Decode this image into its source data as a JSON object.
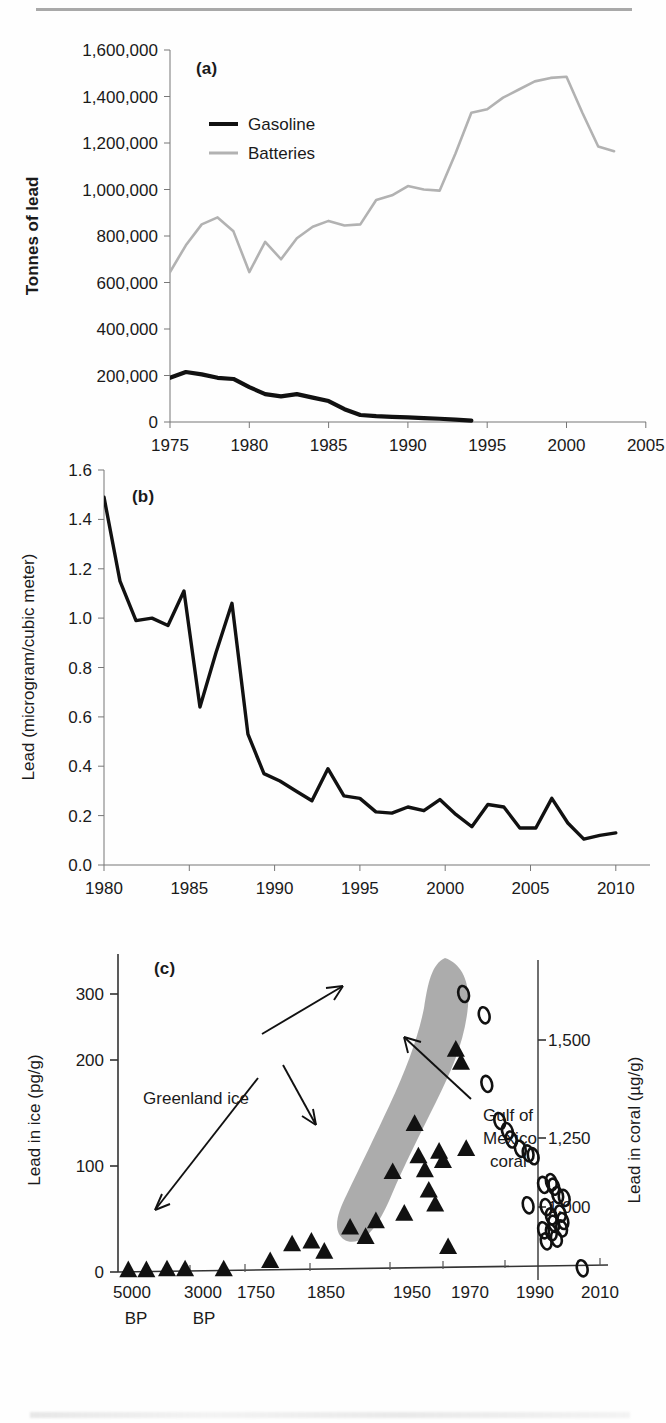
{
  "figure": {
    "panel_labels": {
      "a": "(a)",
      "b": "(b)",
      "c": "(c)"
    }
  },
  "chart_data": [
    {
      "id": "panel-a",
      "type": "line",
      "panel_label": "(a)",
      "title": "",
      "xlabel": "",
      "ylabel": "Tonnes of lead",
      "xlim": [
        1975,
        2005
      ],
      "ylim": [
        0,
        1600000
      ],
      "xticks": [
        1975,
        1980,
        1985,
        1990,
        1995,
        2000,
        2005
      ],
      "xtick_labels": [
        "1975",
        "1980",
        "1985",
        "1990",
        "1995",
        "2000",
        "2005"
      ],
      "yticks": [
        0,
        200000,
        400000,
        600000,
        800000,
        1000000,
        1200000,
        1400000,
        1600000
      ],
      "ytick_labels": [
        "0",
        "200,000",
        "400,000",
        "600,000",
        "800,000",
        "1,000,000",
        "1,200,000",
        "1,400,000",
        "1,600,000"
      ],
      "grid": false,
      "legend_position": "upper-left-inside",
      "x": [
        1975,
        1976,
        1977,
        1978,
        1979,
        1980,
        1981,
        1982,
        1983,
        1984,
        1985,
        1986,
        1987,
        1988,
        1989,
        1990,
        1991,
        1992,
        1993,
        1994,
        1995,
        1996,
        1997,
        1998,
        1999,
        2000,
        2001,
        2002,
        2003
      ],
      "series": [
        {
          "name": "Gasoline",
          "color": "#111111",
          "values": [
            190000,
            215000,
            205000,
            190000,
            185000,
            150000,
            120000,
            110000,
            120000,
            105000,
            90000,
            55000,
            30000,
            25000,
            22000,
            20000,
            17000,
            14000,
            10000,
            6000,
            null,
            null,
            null,
            null,
            null,
            null,
            null,
            null,
            null
          ]
        },
        {
          "name": "Batteries",
          "color": "#b2b2b2",
          "values": [
            645000,
            760000,
            850000,
            880000,
            820000,
            645000,
            775000,
            700000,
            790000,
            840000,
            865000,
            845000,
            850000,
            955000,
            975000,
            1015000,
            1000000,
            995000,
            1155000,
            1330000,
            1345000,
            1395000,
            1430000,
            1465000,
            1480000,
            1485000,
            1330000,
            1185000,
            1165000
          ]
        }
      ]
    },
    {
      "id": "panel-b",
      "type": "line",
      "panel_label": "(b)",
      "title": "",
      "xlabel": "",
      "ylabel": "Lead (microgram/cubic meter)",
      "xlim": [
        1980,
        2012
      ],
      "ylim": [
        0.0,
        1.6
      ],
      "xticks": [
        1980,
        1985,
        1990,
        1995,
        2000,
        2005,
        2010
      ],
      "xtick_labels": [
        "1980",
        "1985",
        "1990",
        "1995",
        "2000",
        "2005",
        "2010"
      ],
      "yticks": [
        0.0,
        0.2,
        0.4,
        0.6,
        0.8,
        1.0,
        1.2,
        1.4,
        1.6
      ],
      "ytick_labels": [
        "0.0",
        "0.2",
        "0.4",
        "0.6",
        "0.8",
        "1.0",
        "1.2",
        "1.4",
        "1.6"
      ],
      "grid": false,
      "legend_position": "none",
      "x": [
        1980,
        1981,
        1982,
        1983,
        1984,
        1985,
        1986,
        1987,
        1988,
        1989,
        1990,
        1991,
        1992,
        1993,
        1994,
        1995,
        1996,
        1997,
        1998,
        1999,
        2000,
        2001,
        2002,
        2003,
        2004,
        2005,
        2006,
        2007,
        2008,
        2009,
        2010,
        2011,
        2012
      ],
      "series": [
        {
          "name": "Lead in air",
          "color": "#111111",
          "values": [
            1.49,
            1.15,
            0.99,
            1.0,
            0.97,
            1.11,
            0.64,
            0.86,
            1.06,
            0.53,
            0.37,
            0.34,
            0.3,
            0.26,
            0.39,
            0.28,
            0.27,
            0.215,
            0.21,
            0.235,
            0.22,
            0.265,
            0.205,
            0.155,
            0.245,
            0.235,
            0.15,
            0.15,
            0.27,
            0.17,
            0.105,
            0.12,
            0.13
          ]
        }
      ]
    },
    {
      "id": "panel-c",
      "type": "scatter",
      "panel_label": "(c)",
      "title": "",
      "xlabel": "",
      "ylabel": "Lead in ice (pg/g)",
      "ylabel_right": "Lead in coral (µg/g)",
      "ylim": [
        0,
        320
      ],
      "yticks": [
        0,
        100,
        200,
        300
      ],
      "ytick_labels": [
        "0",
        "100",
        "200",
        "300"
      ],
      "yticks_right": [
        1000,
        1250,
        1500
      ],
      "ytick_labels_right": [
        "1,000",
        "1,250",
        "1,500"
      ],
      "xtick_labels": [
        "5000",
        "3000",
        "1750",
        "1850",
        "1950",
        "1970",
        "1990",
        "2010"
      ],
      "xtick_sublabels": [
        "BP",
        "BP",
        "",
        "",
        "",
        "",
        "",
        ""
      ],
      "grid": false,
      "annotations": [
        {
          "text": "Greenland ice",
          "target": "triangles"
        },
        {
          "text": "Gulf of",
          "target": "coral-band"
        },
        {
          "text": "Mexico",
          "target": "coral-band"
        },
        {
          "text": "coral",
          "target": "coral-band"
        }
      ],
      "series": [
        {
          "name": "Greenland ice",
          "marker": "filled-triangle",
          "color": "#111111",
          "points": [
            [
              8,
              2
            ],
            [
              22,
              2
            ],
            [
              38,
              3
            ],
            [
              52,
              3
            ],
            [
              82,
              3
            ],
            [
              118,
              12
            ],
            [
              135,
              30
            ],
            [
              150,
              33
            ],
            [
              160,
              22
            ],
            [
              180,
              48
            ],
            [
              192,
              38
            ],
            [
              200,
              55
            ],
            [
              213,
              108
            ],
            [
              222,
              63
            ],
            [
              230,
              160
            ],
            [
              233,
              125
            ],
            [
              238,
              110
            ],
            [
              241,
              88
            ],
            [
              246,
              73
            ],
            [
              249,
              130
            ],
            [
              252,
              120
            ],
            [
              256,
              27
            ],
            [
              262,
              240
            ],
            [
              266,
              226
            ],
            [
              270,
              133
            ]
          ]
        },
        {
          "name": "Gulf of Mexico coral",
          "marker": "open-ellipse",
          "color": "#111111",
          "points": [
            [
              268,
              300
            ],
            [
              284,
              277
            ],
            [
              286,
              203
            ],
            [
              296,
              163
            ],
            [
              302,
              152
            ],
            [
              305,
              143
            ],
            [
              312,
              133
            ],
            [
              318,
              128
            ],
            [
              322,
              125
            ],
            [
              330,
              94
            ],
            [
              336,
              97
            ],
            [
              338,
              92
            ],
            [
              341,
              83
            ],
            [
              346,
              80
            ],
            [
              318,
              72
            ],
            [
              332,
              70
            ],
            [
              336,
              60
            ],
            [
              343,
              63
            ],
            [
              338,
              52
            ],
            [
              345,
              55
            ],
            [
              330,
              45
            ],
            [
              336,
              43
            ],
            [
              344,
              47
            ],
            [
              332,
              33
            ],
            [
              340,
              36
            ],
            [
              360,
              4
            ]
          ]
        }
      ]
    }
  ]
}
